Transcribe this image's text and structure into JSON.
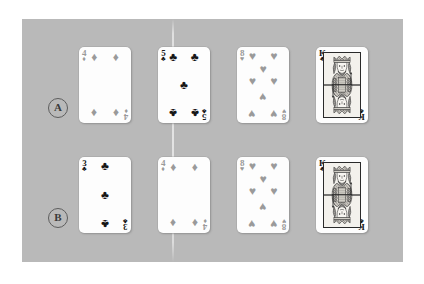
{
  "figure": {
    "background_color": "#ffffff",
    "panel_color": "#b9b9b9",
    "card_face_color": "#fdfdfd",
    "black_suit_color": "#171717",
    "red_suit_color": "#9a9a9a"
  },
  "rows": [
    {
      "label": "A",
      "cards": [
        {
          "rank": "4",
          "suit": "diamonds",
          "suit_glyph": "♦",
          "color_class": "red",
          "pip_layout": "4",
          "is_court": false
        },
        {
          "rank": "5",
          "suit": "clubs",
          "suit_glyph": "♣",
          "color_class": "black",
          "pip_layout": "5",
          "is_court": false
        },
        {
          "rank": "8",
          "suit": "hearts",
          "suit_glyph": "♥",
          "color_class": "red",
          "pip_layout": "8",
          "is_court": false
        },
        {
          "rank": "K",
          "suit": "clubs",
          "suit_glyph": "♣",
          "color_class": "black",
          "pip_layout": "court",
          "is_court": true
        }
      ]
    },
    {
      "label": "B",
      "cards": [
        {
          "rank": "3",
          "suit": "clubs",
          "suit_glyph": "♣",
          "color_class": "black",
          "pip_layout": "3",
          "is_court": false
        },
        {
          "rank": "4",
          "suit": "diamonds",
          "suit_glyph": "♦",
          "color_class": "red",
          "pip_layout": "4",
          "is_court": false
        },
        {
          "rank": "8",
          "suit": "hearts",
          "suit_glyph": "♥",
          "color_class": "red",
          "pip_layout": "8",
          "is_court": false
        },
        {
          "rank": "K",
          "suit": "clubs",
          "suit_glyph": "♣",
          "color_class": "black",
          "pip_layout": "court",
          "is_court": true
        }
      ]
    }
  ]
}
